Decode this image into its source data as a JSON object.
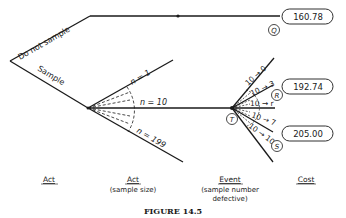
{
  "figure": {
    "caption": "FIGURE 14.5",
    "type": "decision-tree"
  },
  "branches": {
    "do_not_sample": "Do not sample",
    "sample": "Sample",
    "n1": "n = 1",
    "n10": "n = 10",
    "n199": "n = 199"
  },
  "events": [
    {
      "label": "10 → 0"
    },
    {
      "label": "10 → 3"
    },
    {
      "label": "10 → r"
    },
    {
      "label": "10 → 7"
    },
    {
      "label": "10 → 10"
    }
  ],
  "nodes": {
    "q": "Q",
    "r": "R",
    "s": "S",
    "t": "T"
  },
  "costs": {
    "q": "160.78",
    "r": "192.74",
    "s": "205.00"
  },
  "columns": [
    {
      "title": "Act",
      "subtitle": ""
    },
    {
      "title": "Act",
      "subtitle": "(sample size)"
    },
    {
      "title": "Event",
      "subtitle": "(sample number",
      "subtitle2": "defective)"
    },
    {
      "title": "Cost",
      "subtitle": ""
    }
  ]
}
